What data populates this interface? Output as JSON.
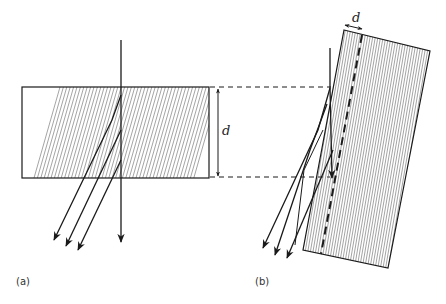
{
  "figure": {
    "panels": [
      {
        "id": "a",
        "label": "(a)",
        "description": "Slab with inclined hatching; incident vertical ray splits into vertical transmitted ray and three oblique rays"
      },
      {
        "id": "b",
        "label": "(b)",
        "description": "Tilted slab with vertical hatching and dashed centre line; incident ray splits into multiple oblique rays"
      }
    ],
    "thickness_label_a": "d",
    "thickness_label_b": "d",
    "colors": {
      "line": "#1a1a1a",
      "hatch": "#555555",
      "background": "#ffffff"
    }
  }
}
